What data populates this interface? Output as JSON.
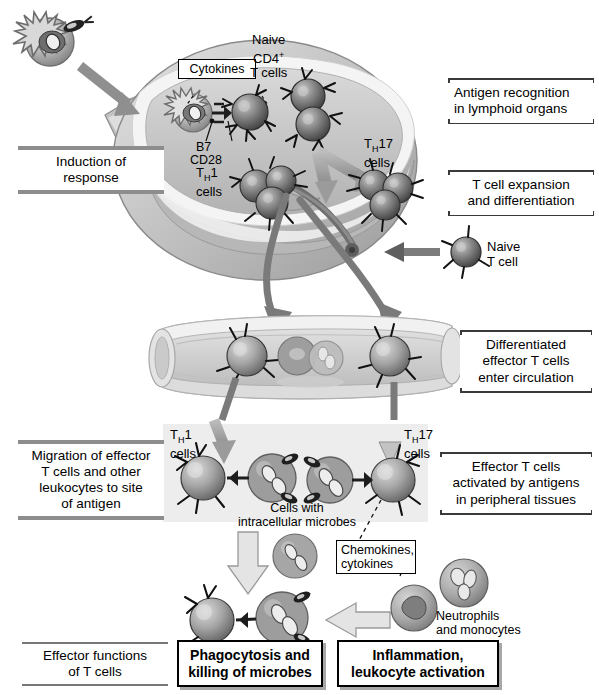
{
  "figure": {
    "palette": {
      "background": "#ffffff",
      "bracket_bar": "#8d8d8d",
      "bracket_rule": "#3a3a3a",
      "arrow_gray": "#8f8f8f",
      "arrow_dark": "#6d6d6d",
      "cell_dark": "#5c5c5c",
      "tissue_fill": "#ededed",
      "node_capsule": "#9a9a9a",
      "node_interior": "#cfcfcf",
      "vessel_fill": "#d4d4d4",
      "box_shadow": "#a8a8a8"
    }
  },
  "stage_labels": {
    "induction": "Induction of\nresponse",
    "antigen_recognition": "Antigen recognition\nin lymphoid organs",
    "t_cell_expansion": "T cell expansion\nand differentiation",
    "differentiated_effector": "Differentiated\neffector T cells\nenter circulation",
    "migration": "Migration of effector\nT cells and other\nleukocytes to site\nof antigen",
    "effector_activated": "Effector T cells\nactivated by antigens\nin peripheral tissues",
    "effector_functions": "Effector functions\nof T cells"
  },
  "callouts": {
    "cytokines": "Cytokines",
    "chemokines_cytokines": "Chemokines,\ncytokines"
  },
  "outcome_boxes": [
    {
      "id": "phagocytosis",
      "label": "Phagocytosis and\nkilling of microbes"
    },
    {
      "id": "inflammation",
      "label": "Inflammation,\nleukocyte activation"
    }
  ],
  "cell_labels": {
    "naive_cd4": "Naive\nCD4",
    "naive_cd4_sup": "+",
    "naive_cd4_tail": "\nT cells",
    "naive_cd4_full": "Naive CD4+ T cells",
    "th1_top": "1\ncells",
    "th17_top": "17\ncells",
    "th1_tissue": "1\ncells",
    "th17_tissue": "17\ncells",
    "th_prefix": "T",
    "th_sub": "H",
    "naive_t_cell": "Naive\nT cell",
    "b7": "B7",
    "cd28": "CD28",
    "cells_with_microbes": "Cells with\nintracellular microbes",
    "neutrophils_monocytes": "Neutrophils\nand monocytes"
  }
}
